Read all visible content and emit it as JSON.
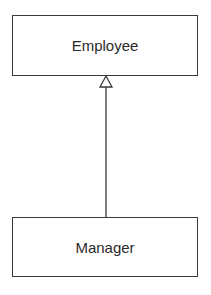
{
  "diagram": {
    "type": "uml-class-inheritance",
    "classes": [
      {
        "id": "employee",
        "name": "Employee"
      },
      {
        "id": "manager",
        "name": "Manager"
      }
    ],
    "relationships": [
      {
        "type": "generalization",
        "from": "manager",
        "to": "employee",
        "arrowhead": "hollow-triangle"
      }
    ],
    "colors": {
      "stroke": "#3a3a3a",
      "text": "#2a2a2a",
      "background": "#ffffff"
    }
  }
}
